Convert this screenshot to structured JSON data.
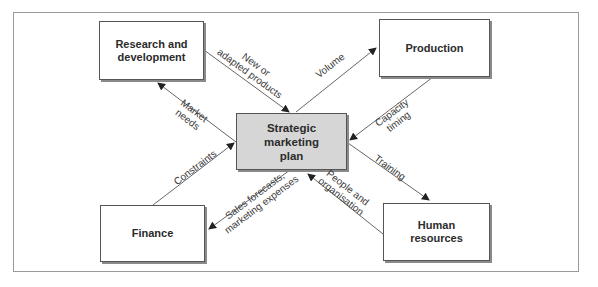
{
  "diagram": {
    "type": "hub-and-spoke flow diagram",
    "colors": {
      "center_fill": "#d6d6d6",
      "box_fill": "#ffffff",
      "line": "#555555",
      "frame": "#9a9a9a"
    },
    "nodes": {
      "center": "Strategic\nmarketing\nplan",
      "rnd": "Research and\ndevelopment",
      "production": "Production",
      "finance": "Finance",
      "hr": "Human\nresources"
    },
    "edges": {
      "new_products": {
        "label": "New or\nadapted products",
        "from": "Research and development",
        "to": "Strategic marketing plan"
      },
      "market_needs": {
        "label": "Market\nneeds",
        "from": "Strategic marketing plan",
        "to": "Research and development"
      },
      "volume": {
        "label": "Volume",
        "from": "Strategic marketing plan",
        "to": "Production"
      },
      "capacity": {
        "label": "Capacity\ntiming",
        "from": "Production",
        "to": "Strategic marketing plan"
      },
      "constraints": {
        "label": "Constraints",
        "from": "Finance",
        "to": "Strategic marketing plan"
      },
      "sales_forecasts": {
        "label": "Sales forecasts,\nmarketing expenses",
        "from": "Strategic marketing plan",
        "to": "Finance"
      },
      "training": {
        "label": "Training",
        "from": "Strategic marketing plan",
        "to": "Human resources"
      },
      "people": {
        "label": "People and\norganisation",
        "from": "Human resources",
        "to": "Strategic marketing plan"
      }
    }
  }
}
